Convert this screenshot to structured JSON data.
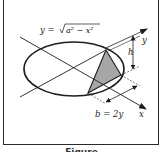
{
  "figure": {
    "equation_label": "y = √(a² − x²)",
    "equation_parts": {
      "lhs": "y = ",
      "radicand": "a² − x²"
    },
    "axis_x_label": "x",
    "axis_y_label": "y",
    "height_label": "h",
    "base_label": "b = 2y",
    "caption": "Figure"
  },
  "colors": {
    "stroke": "#1e1e1e",
    "triangle_fill": "#a6a6a6",
    "background": "#ffffff"
  }
}
